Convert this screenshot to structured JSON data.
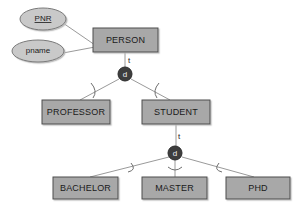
{
  "diagram": {
    "colors": {
      "background": "#ffffff",
      "entity_fill": "#a8a8a8",
      "entity_stroke": "#4d4d4d",
      "attribute_fill": "#c9c9c9",
      "attribute_stroke": "#7a7a7a",
      "connector": "#9a9a9a",
      "arc": "#6e6e6e",
      "circle_fill": "#3d3d3d",
      "circle_text": "#f2f2f2",
      "label_text": "#1a1a1a"
    },
    "entities": [
      {
        "id": "person",
        "label": "PERSON",
        "x": 93,
        "y": 28,
        "w": 65,
        "h": 24
      },
      {
        "id": "professor",
        "label": "PROFESSOR",
        "x": 42,
        "y": 100,
        "w": 68,
        "h": 24
      },
      {
        "id": "student",
        "label": "STUDENT",
        "x": 142,
        "y": 100,
        "w": 68,
        "h": 24
      },
      {
        "id": "bachelor",
        "label": "BACHELOR",
        "x": 53,
        "y": 177,
        "w": 65,
        "h": 22
      },
      {
        "id": "master",
        "label": "MASTER",
        "x": 142,
        "y": 177,
        "w": 65,
        "h": 22
      },
      {
        "id": "phd",
        "label": "PHD",
        "x": 226,
        "y": 177,
        "w": 64,
        "h": 22
      }
    ],
    "attributes": [
      {
        "id": "pnr",
        "label": "PNR",
        "cx": 43,
        "cy": 19,
        "rx": 23,
        "ry": 11,
        "key": true
      },
      {
        "id": "pname",
        "label": "pname",
        "cx": 38,
        "cy": 51,
        "rx": 26,
        "ry": 11,
        "key": false
      }
    ],
    "specialization_circles": [
      {
        "id": "d-person",
        "label": "d",
        "cx": 125,
        "cy": 74,
        "r": 7
      },
      {
        "id": "d-student",
        "label": "d",
        "cx": 175,
        "cy": 153,
        "r": 7
      }
    ],
    "edge_labels": [
      {
        "id": "t-person",
        "label": "t",
        "x": 128,
        "y": 61
      },
      {
        "id": "t-student",
        "label": "t",
        "x": 178,
        "y": 137
      }
    ],
    "connectors": [
      {
        "id": "pnr-person",
        "from": "pnr",
        "to": "person"
      },
      {
        "id": "pname-person",
        "from": "pname",
        "to": "person"
      },
      {
        "id": "person-d",
        "from": "person",
        "to": "d-person"
      },
      {
        "id": "d-professor",
        "from": "d-person",
        "to": "professor"
      },
      {
        "id": "d-student-box",
        "from": "d-person",
        "to": "student"
      },
      {
        "id": "student-d2",
        "from": "student",
        "to": "d-student"
      },
      {
        "id": "d2-bachelor",
        "from": "d-student",
        "to": "bachelor"
      },
      {
        "id": "d2-master",
        "from": "d-student",
        "to": "master"
      },
      {
        "id": "d2-phd",
        "from": "d-student",
        "to": "phd"
      }
    ],
    "subset_arcs": [
      {
        "id": "arc-professor"
      },
      {
        "id": "arc-student"
      },
      {
        "id": "arc-bachelor"
      },
      {
        "id": "arc-master"
      },
      {
        "id": "arc-phd"
      }
    ]
  }
}
